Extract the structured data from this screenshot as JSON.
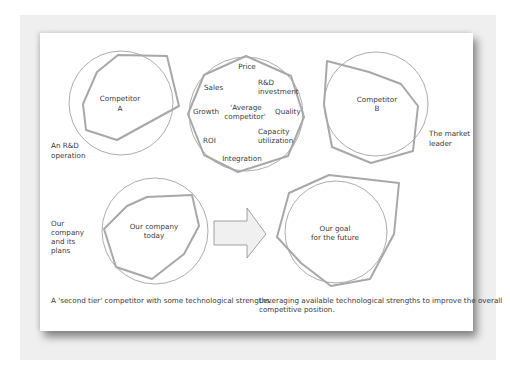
{
  "diagram": {
    "colors": {
      "outer_background": "#efefef",
      "panel_background": "#ffffff",
      "circle_stroke": "#8a8a8a",
      "polygon_stroke": "#a8a8a8",
      "text": "#3a3a3a",
      "arrow_fill": "#f0f0f0",
      "arrow_stroke": "#8a8a8a"
    },
    "competitor_a": {
      "label_line1": "Competitor",
      "label_line2": "A",
      "side_label_line1": "An R&D",
      "side_label_line2": "operation"
    },
    "average_competitor": {
      "center_label_line1": "'Average",
      "center_label_line2": "competitor'",
      "axes": [
        {
          "name": "Price"
        },
        {
          "name": "R&D investment",
          "line1": "R&D",
          "line2": "investment"
        },
        {
          "name": "Quality"
        },
        {
          "name": "Capacity utilization",
          "line1": "Capacity",
          "line2": "utilization"
        },
        {
          "name": "Integration"
        },
        {
          "name": "ROI"
        },
        {
          "name": "Growth"
        },
        {
          "name": "Sales"
        }
      ]
    },
    "competitor_b": {
      "label_line1": "Competitor",
      "label_line2": "B",
      "side_label_line1": "The market",
      "side_label_line2": "leader"
    },
    "our_company": {
      "label_line1": "Our company",
      "label_line2": "today",
      "side_label_lines": [
        "Our",
        "company",
        "and its",
        "plans"
      ],
      "caption": "A 'second tier' competitor with some technological strengths."
    },
    "our_goal": {
      "label_line1": "Our goal",
      "label_line2": "for the future",
      "caption_line1": "Leveraging available technological strengths to improve the overall",
      "caption_line2": "competitive position."
    },
    "arrow": {
      "direction": "right"
    }
  }
}
